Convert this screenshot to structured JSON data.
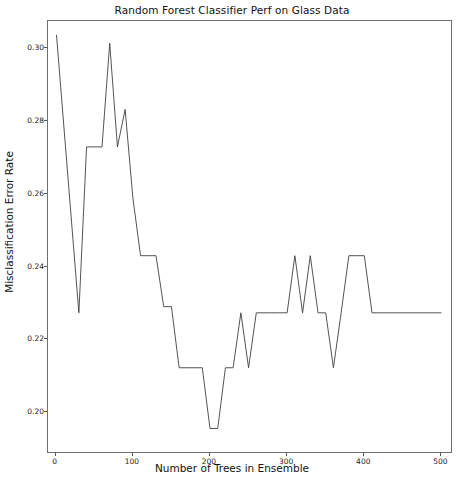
{
  "chart_data": {
    "type": "line",
    "title": "Random Forest Classifier Perf on Glass Data",
    "xlabel": "Number of Trees in Ensemble",
    "ylabel": "Misclassification Error Rate",
    "xlim": [
      -10,
      515
    ],
    "ylim": [
      0.1885,
      0.3075
    ],
    "grid": false,
    "legend": null,
    "xticks": [
      0,
      100,
      200,
      300,
      400,
      500
    ],
    "xtick_labels": [
      "0",
      "100",
      "200",
      "300",
      "400",
      "500"
    ],
    "yticks": [
      0.2,
      0.22,
      0.24,
      0.26,
      0.28,
      0.3
    ],
    "ytick_labels": [
      "0.20",
      "0.22",
      "0.24",
      "0.26",
      "0.28",
      "0.30"
    ],
    "line_color": "#404040",
    "line_width": 0.9,
    "series": [
      {
        "name": "Misclassification Error Rate",
        "x": [
          1,
          30,
          40,
          50,
          60,
          70,
          80,
          90,
          100,
          110,
          120,
          130,
          140,
          150,
          160,
          170,
          180,
          190,
          200,
          210,
          220,
          230,
          240,
          250,
          260,
          270,
          280,
          290,
          300,
          310,
          320,
          330,
          340,
          350,
          360,
          370,
          380,
          390,
          400,
          410,
          420,
          430,
          440,
          450,
          460,
          470,
          480,
          490,
          500
        ],
        "y": [
          0.3037,
          0.2273,
          0.2729,
          0.2729,
          0.2729,
          0.3014,
          0.2729,
          0.2832,
          0.2589,
          0.243,
          0.243,
          0.243,
          0.229,
          0.229,
          0.2122,
          0.2122,
          0.2122,
          0.2122,
          0.1955,
          0.1955,
          0.2122,
          0.2122,
          0.2273,
          0.2122,
          0.2273,
          0.2273,
          0.2273,
          0.2273,
          0.2273,
          0.243,
          0.2273,
          0.243,
          0.2273,
          0.2273,
          0.2122,
          0.2273,
          0.243,
          0.243,
          0.243,
          0.2273,
          0.2273,
          0.2273,
          0.2273,
          0.2273,
          0.2273,
          0.2273,
          0.2273,
          0.2273,
          0.2273
        ]
      }
    ]
  }
}
